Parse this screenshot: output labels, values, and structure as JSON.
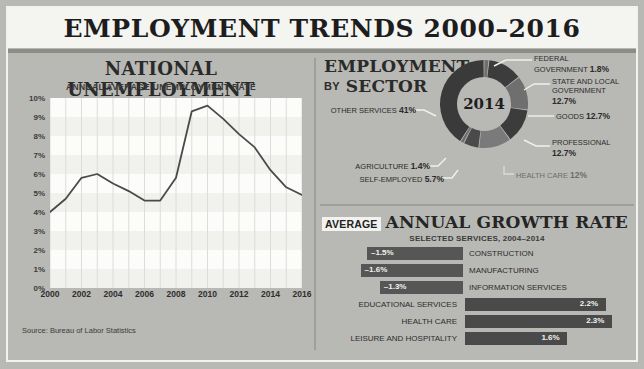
{
  "poster": {
    "title": "EMPLOYMENT TRENDS 2000–2016",
    "source": "Source: Bureau of Labor Statistics"
  },
  "line_panel": {
    "title": "NATIONAL UNEMPLOYMENT",
    "subtitle": "ANNUAL AVERAGE UNEMPLOYMENT RATE"
  },
  "sector_panel": {
    "title_line1": "EMPLOYMENT",
    "title_by": "BY",
    "title_line2": "SECTOR",
    "center_year": "2014"
  },
  "growth_panel": {
    "title_prefix": "AVERAGE",
    "title_main": "ANNUAL GROWTH RATE",
    "subtitle": "SELECTED SERVICES, 2004–2014"
  },
  "chart_data": [
    {
      "type": "line",
      "title": "NATIONAL UNEMPLOYMENT",
      "subtitle": "ANNUAL AVERAGE UNEMPLOYMENT RATE",
      "xlabel": "",
      "ylabel": "",
      "x": [
        2000,
        2001,
        2002,
        2003,
        2004,
        2005,
        2006,
        2007,
        2008,
        2009,
        2010,
        2011,
        2012,
        2013,
        2014,
        2015,
        2016
      ],
      "values": [
        4.0,
        4.7,
        5.8,
        6.0,
        5.5,
        5.1,
        4.6,
        4.6,
        5.8,
        9.3,
        9.6,
        8.9,
        8.1,
        7.4,
        6.2,
        5.3,
        4.9
      ],
      "xticks": [
        "2000",
        "2002",
        "2004",
        "2006",
        "2008",
        "2010",
        "2012",
        "2014",
        "2016"
      ],
      "yticks": [
        "0%",
        "1%",
        "2%",
        "3%",
        "4%",
        "5%",
        "6%",
        "7%",
        "8%",
        "9%",
        "10%"
      ],
      "ylim": [
        0,
        10
      ],
      "xlim": [
        2000,
        2016
      ],
      "grid": true,
      "line_color": "#4a4a4a"
    },
    {
      "type": "pie",
      "title": "EMPLOYMENT BY SECTOR",
      "center_label": "2014",
      "labels": [
        "FEDERAL GOVERNMENT",
        "STATE AND LOCAL GOVERNMENT",
        "GOODS",
        "PROFESSIONAL",
        "HEALTH CARE",
        "SELF-EMPLOYED",
        "AGRICULTURE",
        "OTHER SERVICES"
      ],
      "values": [
        1.8,
        12.7,
        12.7,
        12.7,
        12.0,
        5.7,
        1.4,
        41.0
      ],
      "value_labels": [
        "1.8%",
        "12.7%",
        "12.7%",
        "12.7%",
        "12%",
        "5.7%",
        "1.4%",
        "41%"
      ],
      "legend": "callouts"
    },
    {
      "type": "bar",
      "title": "AVERAGE ANNUAL GROWTH RATE",
      "subtitle": "SELECTED SERVICES, 2004–2014",
      "orientation": "horizontal",
      "categories": [
        "CONSTRUCTION",
        "MANUFACTURING",
        "INFORMATION SERVICES",
        "EDUCATIONAL SERVICES",
        "HEALTH CARE",
        "LEISURE AND HOSPITALITY"
      ],
      "values": [
        -1.5,
        -1.6,
        -1.3,
        2.2,
        2.3,
        1.6
      ],
      "value_labels": [
        "–1.5%",
        "–1.6%",
        "–1.3%",
        "2.2%",
        "2.3%",
        "1.6%"
      ],
      "xlim": [
        -2.0,
        2.6
      ],
      "bar_color": "#4a4a4a"
    }
  ],
  "donut_callouts": [
    {
      "name": "FEDERAL GOVERNMENT",
      "text_line1": "FEDERAL",
      "text_line2": "GOVERNMENT",
      "value": "1.8%"
    },
    {
      "name": "STATE AND LOCAL GOVERNMENT",
      "text_line1": "STATE AND LOCAL",
      "text_line2": "GOVERNMENT",
      "value": "12.7%"
    },
    {
      "name": "GOODS",
      "text_line1": "GOODS",
      "value": "12.7%"
    },
    {
      "name": "PROFESSIONAL",
      "text_line1": "PROFESSIONAL",
      "value": "12.7%"
    },
    {
      "name": "HEALTH CARE",
      "text_line1": "HEALTH CARE",
      "value": "12%"
    },
    {
      "name": "SELF-EMPLOYED",
      "text_line1": "SELF-EMPLOYED",
      "value": "5.7%"
    },
    {
      "name": "AGRICULTURE",
      "text_line1": "AGRICULTURE",
      "value": "1.4%"
    },
    {
      "name": "OTHER SERVICES",
      "text_line1": "OTHER SERVICES",
      "value": "41%"
    }
  ],
  "colors": {
    "background": "#b8b8b4",
    "panel": "#f4f4f1",
    "ink": "#2a2a2a",
    "bar": "#4a4a4a",
    "donut_dark": "#3a3a3a",
    "donut_mid": "#6a6a6a"
  }
}
